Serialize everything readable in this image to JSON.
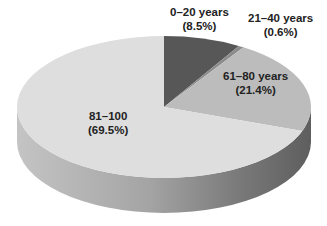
{
  "chart_data": {
    "type": "pie",
    "style": "3d",
    "title": "",
    "categories": [
      "0–20 years",
      "21–40 years",
      "61–80 years",
      "81–100"
    ],
    "values": [
      8.5,
      0.6,
      21.4,
      69.5
    ],
    "unit": "%",
    "start_angle": "12 o'clock",
    "direction": "clockwise",
    "colors": [
      "#575757",
      "#8c8c8c",
      "#bcbcbc",
      "#dedede"
    ],
    "labels": [
      {
        "name": "0–20 years",
        "pct": "(8.5%)"
      },
      {
        "name": "21–40 years",
        "pct": "(0.6%)"
      },
      {
        "name": "61–80 years",
        "pct": "(21.4%)"
      },
      {
        "name": "81–100",
        "pct": "(69.5%)"
      }
    ],
    "legend": "none"
  }
}
